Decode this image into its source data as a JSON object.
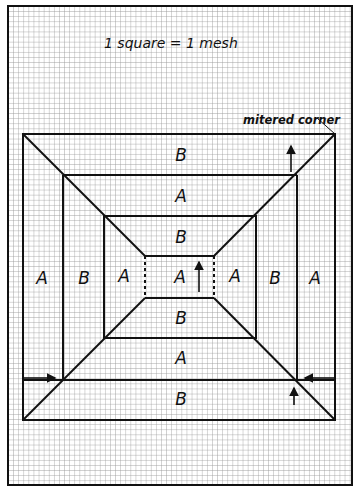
{
  "diagram": {
    "title_note": "1 square = 1 mesh",
    "callout": "mitered corner",
    "colors": {
      "grid_line": "#9a9a9a",
      "outline": "#111111",
      "paper": "#ffffff"
    },
    "regions": {
      "top_outer": "B",
      "top_middle": "A",
      "top_inner": "B",
      "left_outer": "A",
      "left_middle": "B",
      "left_inner": "A",
      "center": "A",
      "right_inner": "A",
      "right_middle": "B",
      "right_outer": "A",
      "bottom_inner": "B",
      "bottom_middle": "A",
      "bottom_outer": "B"
    },
    "arrows": [
      {
        "name": "top-right-up-arrow",
        "direction": "up"
      },
      {
        "name": "center-up-arrow",
        "direction": "up"
      },
      {
        "name": "bottom-left-right-arrow",
        "direction": "right"
      },
      {
        "name": "bottom-right-left-arrow",
        "direction": "left"
      },
      {
        "name": "bottom-right-up-arrow",
        "direction": "up"
      }
    ]
  }
}
